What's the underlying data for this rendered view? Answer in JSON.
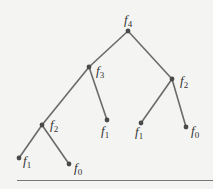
{
  "diagram": {
    "type": "tree",
    "colors": {
      "background": "#f4f4f2",
      "edge": "#6a6a6a",
      "node": "#4a4a4a",
      "label": "#333333"
    },
    "nodes": [
      {
        "id": "n0",
        "base": "f",
        "sub": "4",
        "x": 128,
        "y": 31,
        "lx": 124,
        "ly": 13
      },
      {
        "id": "n1",
        "base": "f",
        "sub": "3",
        "x": 89,
        "y": 67,
        "lx": 96,
        "ly": 64
      },
      {
        "id": "n2",
        "base": "f",
        "sub": "2",
        "x": 172,
        "y": 79,
        "lx": 180,
        "ly": 74
      },
      {
        "id": "n3",
        "base": "f",
        "sub": "2",
        "x": 42,
        "y": 125,
        "lx": 50,
        "ly": 118
      },
      {
        "id": "n4",
        "base": "f",
        "sub": "1",
        "x": 107,
        "y": 120,
        "lx": 101,
        "ly": 124
      },
      {
        "id": "n5",
        "base": "f",
        "sub": "1",
        "x": 141,
        "y": 123,
        "lx": 135,
        "ly": 125
      },
      {
        "id": "n6",
        "base": "f",
        "sub": "0",
        "x": 186,
        "y": 127,
        "lx": 191,
        "ly": 124
      },
      {
        "id": "n7",
        "base": "f",
        "sub": "1",
        "x": 19,
        "y": 158,
        "lx": 23,
        "ly": 154
      },
      {
        "id": "n8",
        "base": "f",
        "sub": "0",
        "x": 69,
        "y": 164,
        "lx": 74,
        "ly": 161
      }
    ],
    "edges": [
      {
        "from": "n0",
        "to": "n1"
      },
      {
        "from": "n0",
        "to": "n2"
      },
      {
        "from": "n1",
        "to": "n3"
      },
      {
        "from": "n1",
        "to": "n4"
      },
      {
        "from": "n2",
        "to": "n5"
      },
      {
        "from": "n2",
        "to": "n6"
      },
      {
        "from": "n3",
        "to": "n7"
      },
      {
        "from": "n3",
        "to": "n8"
      }
    ]
  }
}
